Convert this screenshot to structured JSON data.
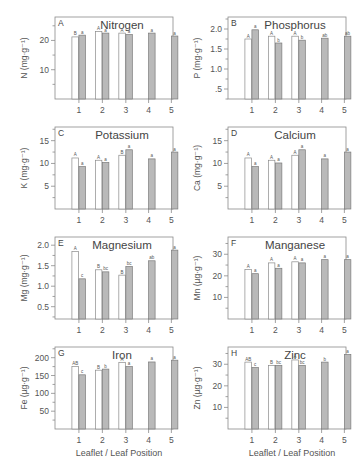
{
  "chart_data": [
    {
      "type": "bar",
      "panel": "A",
      "title": "Nitrogen",
      "ylabel": "N (mg·g⁻¹)",
      "xlabel": "",
      "categories": [
        "1",
        "2",
        "3",
        "4",
        "5"
      ],
      "yticks": [
        10,
        20
      ],
      "ytick_labels": [
        "10",
        "20"
      ],
      "ylim": [
        0,
        28
      ],
      "series": [
        {
          "name": "Leaflet",
          "color": "#ffffff",
          "values": [
            21.2,
            23.0,
            22.5,
            null,
            null
          ],
          "letters": [
            "B",
            "A",
            "A",
            null,
            null
          ]
        },
        {
          "name": "Leaf",
          "color": "#b9b9b9",
          "values": [
            21.8,
            22.5,
            22.0,
            22.5,
            21.5
          ],
          "letters": [
            "a",
            "a",
            "a",
            "a",
            "a"
          ]
        }
      ]
    },
    {
      "type": "bar",
      "panel": "B",
      "title": "Phosphorus",
      "ylabel": "P (mg·g⁻¹)",
      "xlabel": "",
      "categories": [
        "1",
        "2",
        "3",
        "4",
        "5"
      ],
      "yticks": [
        0.5,
        1.0,
        1.5,
        2.0
      ],
      "ytick_labels": [
        ".5",
        "1.0",
        "1.5",
        "2.0"
      ],
      "ylim": [
        0.25,
        2.3
      ],
      "series": [
        {
          "name": "Leaflet",
          "color": "#ffffff",
          "values": [
            1.75,
            1.82,
            1.82,
            null,
            null
          ],
          "letters": [
            "A",
            "A",
            "A",
            null,
            null
          ]
        },
        {
          "name": "Leaf",
          "color": "#b9b9b9",
          "values": [
            1.98,
            1.65,
            1.72,
            1.77,
            1.82
          ],
          "letters": [
            "a",
            "b",
            "b",
            "ab",
            "ab"
          ]
        }
      ]
    },
    {
      "type": "bar",
      "panel": "C",
      "title": "Potassium",
      "ylabel": "K (mg·g⁻¹)",
      "xlabel": "",
      "categories": [
        "1",
        "2",
        "3",
        "4",
        "5"
      ],
      "yticks": [
        5,
        10,
        15
      ],
      "ytick_labels": [
        "5",
        "10",
        "15"
      ],
      "ylim": [
        0,
        18
      ],
      "series": [
        {
          "name": "Leaflet",
          "color": "#ffffff",
          "values": [
            11.2,
            10.7,
            11.8,
            null,
            null
          ],
          "letters": [
            "A",
            "A",
            "B",
            null,
            null
          ]
        },
        {
          "name": "Leaf",
          "color": "#b9b9b9",
          "values": [
            9.3,
            10.2,
            13.0,
            11.0,
            12.5
          ],
          "letters": [
            "a",
            "a",
            "a",
            "a",
            "a"
          ]
        }
      ]
    },
    {
      "type": "bar",
      "panel": "D",
      "title": "Calcium",
      "ylabel": "Ca (mg·g⁻¹)",
      "xlabel": "",
      "categories": [
        "1",
        "2",
        "3",
        "4",
        "5"
      ],
      "yticks": [
        5,
        10,
        15
      ],
      "ytick_labels": [
        "5",
        "10",
        "15"
      ],
      "ylim": [
        0,
        18
      ],
      "series": [
        {
          "name": "Leaflet",
          "color": "#ffffff",
          "values": [
            11.2,
            10.7,
            11.8,
            null,
            null
          ],
          "letters": [
            "A",
            "A",
            "A",
            null,
            null
          ]
        },
        {
          "name": "Leaf",
          "color": "#b9b9b9",
          "values": [
            9.3,
            10.1,
            13.0,
            11.0,
            12.5
          ],
          "letters": [
            "a",
            "a",
            "a",
            "a",
            "a"
          ]
        }
      ]
    },
    {
      "type": "bar",
      "panel": "E",
      "title": "Magnesium",
      "ylabel": "Mg (mg·g⁻¹)",
      "xlabel": "",
      "categories": [
        "1",
        "2",
        "3",
        "4",
        "5"
      ],
      "yticks": [
        0.5,
        1.0,
        1.5,
        2.0
      ],
      "ytick_labels": [
        "0.5",
        "1.0",
        "1.5",
        "2.0"
      ],
      "ylim": [
        0.2,
        2.2
      ],
      "series": [
        {
          "name": "Leaflet",
          "color": "#ffffff",
          "values": [
            1.85,
            1.4,
            1.27,
            null,
            null
          ],
          "letters": [
            "A",
            "B",
            "B",
            null,
            null
          ]
        },
        {
          "name": "Leaf",
          "color": "#b9b9b9",
          "values": [
            1.18,
            1.35,
            1.48,
            1.62,
            1.88
          ],
          "letters": [
            "c",
            "bc",
            "bc",
            "ab",
            "a"
          ]
        }
      ]
    },
    {
      "type": "bar",
      "panel": "F",
      "title": "Manganese",
      "ylabel": "Mn (µg·g⁻¹)",
      "xlabel": "",
      "categories": [
        "1",
        "2",
        "3",
        "4",
        "5"
      ],
      "yticks": [
        10,
        20,
        30
      ],
      "ytick_labels": [
        "10",
        "20",
        "30"
      ],
      "ylim": [
        0,
        38
      ],
      "series": [
        {
          "name": "Leaflet",
          "color": "#ffffff",
          "values": [
            23.0,
            26.0,
            26.5,
            null,
            null
          ],
          "letters": [
            "A",
            "A",
            "A",
            null,
            null
          ]
        },
        {
          "name": "Leaf",
          "color": "#b9b9b9",
          "values": [
            21.0,
            23.5,
            26.0,
            27.5,
            27.5
          ],
          "letters": [
            "a",
            "a",
            "a",
            "a",
            "a"
          ]
        }
      ]
    },
    {
      "type": "bar",
      "panel": "G",
      "title": "Iron",
      "ylabel": "Fe (µg·g⁻¹)",
      "xlabel": "Leaflet / Leaf Position",
      "categories": [
        "1",
        "2",
        "3",
        "4",
        "5"
      ],
      "yticks": [
        50,
        100,
        150,
        200
      ],
      "ytick_labels": [
        "50",
        "100",
        "150",
        "200"
      ],
      "ylim": [
        0,
        230
      ],
      "series": [
        {
          "name": "Leaflet",
          "color": "#ffffff",
          "values": [
            175,
            165,
            187,
            null,
            null
          ],
          "letters": [
            "AB",
            "B",
            "A",
            null,
            null
          ]
        },
        {
          "name": "Leaf",
          "color": "#b9b9b9",
          "values": [
            152,
            168,
            175,
            188,
            193
          ],
          "letters": [
            "c",
            "b",
            "a",
            "a",
            "a"
          ]
        }
      ]
    },
    {
      "type": "bar",
      "panel": "H",
      "title": "Zinc",
      "ylabel": "Zn (µg·g⁻¹)",
      "xlabel": "Leaflet / Leaf Position",
      "categories": [
        "1",
        "2",
        "3",
        "4",
        "5"
      ],
      "yticks": [
        10,
        20,
        30
      ],
      "ytick_labels": [
        "10",
        "20",
        "30"
      ],
      "ylim": [
        0,
        38
      ],
      "series": [
        {
          "name": "Leaflet",
          "color": "#ffffff",
          "values": [
            31.0,
            29.5,
            32.0,
            null,
            null
          ],
          "letters": [
            "AB",
            "B",
            "A",
            null,
            null
          ]
        },
        {
          "name": "Leaf",
          "color": "#b9b9b9",
          "values": [
            28.5,
            29.5,
            29.5,
            31.0,
            34.5
          ],
          "letters": [
            "c",
            "bc",
            "bc",
            "b",
            "a"
          ]
        }
      ]
    }
  ]
}
